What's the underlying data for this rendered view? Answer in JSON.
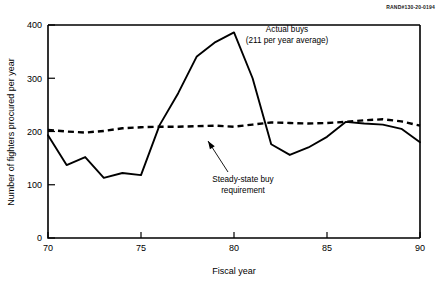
{
  "figure": {
    "corner_id": "RAND#130-20-0194"
  },
  "chart_data": {
    "type": "line",
    "title": "",
    "xlabel": "Fiscal year",
    "ylabel": "Number of fighters procured per year",
    "xlim": [
      70,
      90
    ],
    "ylim": [
      0,
      400
    ],
    "xticks": [
      70,
      75,
      80,
      85,
      90
    ],
    "xticklabels": [
      "70",
      "75",
      "80",
      "85",
      "90"
    ],
    "yticks": [
      0,
      100,
      200,
      300,
      400
    ],
    "yticklabels": [
      "0",
      "100",
      "200",
      "300",
      "400"
    ],
    "grid": false,
    "legend": "none",
    "x": [
      70,
      71,
      72,
      73,
      74,
      75,
      76,
      77,
      78,
      79,
      80,
      81,
      82,
      83,
      84,
      85,
      86,
      87,
      88,
      89,
      90
    ],
    "series": [
      {
        "name": "Actual buys",
        "style": "solid",
        "values": [
          193,
          137,
          152,
          113,
          122,
          118,
          212,
          272,
          341,
          368,
          386,
          300,
          176,
          156,
          170,
          190,
          218,
          215,
          213,
          205,
          180
        ]
      },
      {
        "name": "Steady-state buy requirement",
        "style": "dashed",
        "values": [
          203,
          200,
          198,
          201,
          206,
          208,
          209,
          209,
          210,
          211,
          209,
          213,
          217,
          216,
          215,
          216,
          218,
          221,
          223,
          219,
          211
        ]
      }
    ],
    "annotations": [
      {
        "id": "actual-buys",
        "lines": [
          "Actual buys",
          "(211 per year average)"
        ],
        "x": 287,
        "y": 32,
        "anchor": "middle",
        "leader": false
      },
      {
        "id": "steady-state",
        "lines": [
          "Steady-state buy",
          "requirement"
        ],
        "x": 243,
        "y": 182,
        "anchor": "middle",
        "leader": true,
        "leader_from_x": 228,
        "leader_from_y": 172,
        "leader_to_x": 208,
        "leader_to_y": 141
      }
    ]
  }
}
